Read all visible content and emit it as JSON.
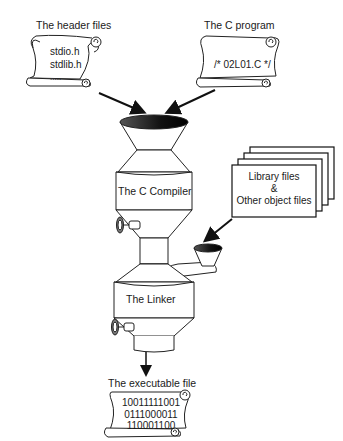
{
  "diagram": {
    "header_files": {
      "title": "The header files",
      "lines": [
        "stdio.h",
        "stdlib.h",
        "....."
      ]
    },
    "c_program": {
      "title": "The C program",
      "lines": [
        "/* 02L01.C */"
      ]
    },
    "compiler": {
      "label": "The C Compiler"
    },
    "library_files": {
      "lines": [
        "Library files",
        "&",
        "Other object files"
      ]
    },
    "linker": {
      "label": "The Linker"
    },
    "executable": {
      "title": "The executable file",
      "lines": [
        "10011111001",
        "0111000011",
        "110001100"
      ]
    }
  }
}
